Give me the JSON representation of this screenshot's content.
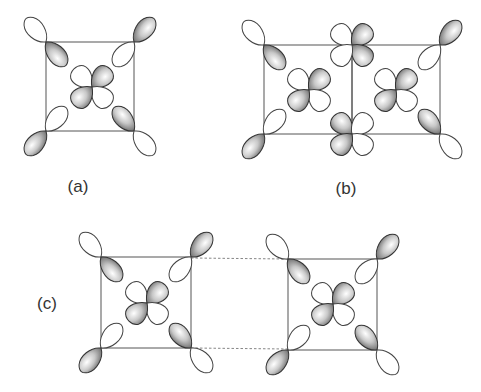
{
  "figure": {
    "panels": [
      {
        "id": "a",
        "label": "(a)",
        "description": "single cell: corner d-orbitals with central d-orbital"
      },
      {
        "id": "b",
        "label": "(b)",
        "description": "two adjacent cells sharing an edge"
      },
      {
        "id": "c",
        "label": "(c)",
        "description": "two separated cells connected by dashed lines"
      }
    ],
    "colors": {
      "shaded_lobe": "#8a8a8a",
      "outline": "#444444",
      "cell_edge": "#555555",
      "dashed_bond": "#777777"
    }
  }
}
